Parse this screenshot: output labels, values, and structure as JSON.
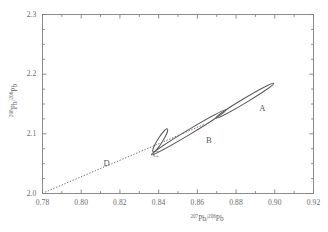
{
  "chart_data": {
    "type": "scatter",
    "title": "",
    "subtitle": "",
    "xlabel": "207Pb/206Pb",
    "ylabel": "208Pb/206Pb",
    "xlabel_parts": {
      "sup1": "207",
      "iso1": "Pb",
      "slash": "/",
      "sup2": "206",
      "iso2": "Pb"
    },
    "ylabel_parts": {
      "sup1": "208",
      "iso1": "Pb",
      "slash": "/",
      "sup2": "206",
      "iso2": "Pb"
    },
    "xlim": [
      0.78,
      0.92
    ],
    "ylim": [
      2.0,
      2.3
    ],
    "xticks": [
      0.78,
      0.8,
      0.82,
      0.84,
      0.86,
      0.88,
      0.9,
      0.92
    ],
    "yticks": [
      2.0,
      2.1,
      2.2,
      2.3
    ],
    "xtick_labels": [
      "0.78",
      "0.80",
      "0.82",
      "0.84",
      "0.86",
      "0.88",
      "0.90",
      "0.92"
    ],
    "ytick_labels": [
      "2.0",
      "2.1",
      "2.2",
      "2.3"
    ],
    "xminor_step": 0.01,
    "yminor_step": 0.025,
    "grid": false,
    "legend": "none",
    "ticks_inward": true,
    "ticks_all_sides": true,
    "frame_color": "#808080",
    "series": [
      {
        "name": "A",
        "label": "A",
        "shape": "ellipse",
        "center_x": 0.8845,
        "center_y": 2.1555,
        "semi_major": 0.0175,
        "semi_minor": 0.0038,
        "angle_deg": -31,
        "label_x": 0.8935,
        "label_y": 2.1415,
        "stroke": "#555555"
      },
      {
        "name": "B",
        "label": "B",
        "shape": "ellipse",
        "center_x": 0.8555,
        "center_y": 2.1025,
        "semi_major": 0.0225,
        "semi_minor": 0.004,
        "angle_deg": -31,
        "label_x": 0.866,
        "label_y": 2.088,
        "stroke": "#555555"
      },
      {
        "name": "C",
        "label": "C",
        "shape": "ellipse",
        "center_x": 0.8408,
        "center_y": 2.089,
        "semi_major": 0.007,
        "semi_minor": 0.0042,
        "angle_deg": -58,
        "label_x": 0.8385,
        "label_y": 2.064,
        "stroke": "#555555"
      },
      {
        "name": "D",
        "label": "D",
        "shape": "dotted-line",
        "x_start": 0.7815,
        "y_start": 2.0025,
        "x_end": 0.864,
        "y_end": 2.1165,
        "label_x": 0.813,
        "label_y": 2.05,
        "stroke": "#6a6a6a"
      }
    ]
  }
}
